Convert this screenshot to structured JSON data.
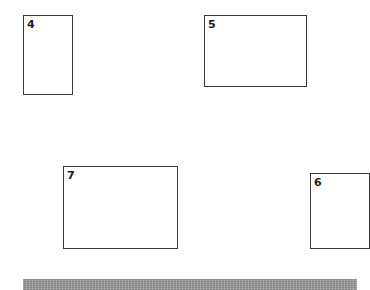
{
  "diagram": {
    "boxes": [
      {
        "label": "4",
        "x": 23,
        "y": 15,
        "w": 50,
        "h": 80
      },
      {
        "label": "5",
        "x": 204,
        "y": 15,
        "w": 103,
        "h": 72
      },
      {
        "label": "7",
        "x": 63,
        "y": 166,
        "w": 115,
        "h": 83
      },
      {
        "label": "6",
        "x": 310,
        "y": 173,
        "w": 60,
        "h": 76
      }
    ],
    "bar": {
      "x": 23,
      "y": 279,
      "w": 334,
      "h": 11,
      "color": "#9a9a9a"
    },
    "colors": {
      "background": "#ffffff",
      "border": "#3a3a3a",
      "text": "#1a1a1a"
    }
  }
}
